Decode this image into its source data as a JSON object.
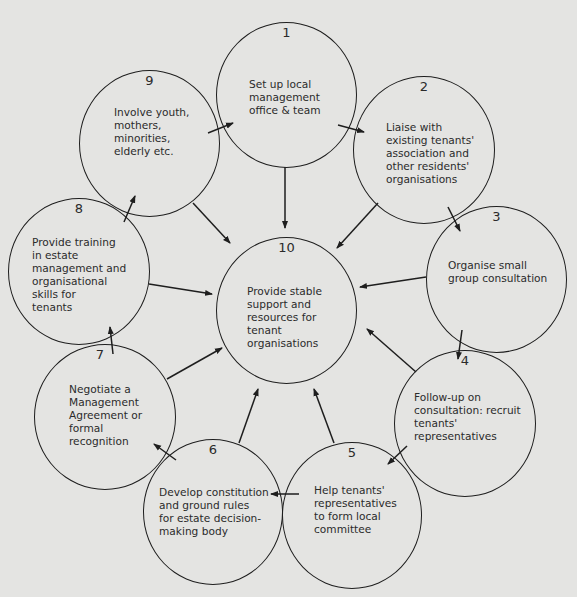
{
  "diagram": {
    "type": "cycle",
    "center": {
      "number": "10",
      "text": "Provide stable\nsupport and\nresources for\ntenant\norganisations"
    },
    "steps": [
      {
        "number": "1",
        "text": "Set up local\nmanagement\noffice & team"
      },
      {
        "number": "2",
        "text": "Liaise with\nexisting tenants'\nassociation and\nother residents'\norganisations"
      },
      {
        "number": "3",
        "text": "Organise small\ngroup consultation"
      },
      {
        "number": "4",
        "text": "Follow-up on\nconsultation: recruit\ntenants'\nrepresentatives"
      },
      {
        "number": "5",
        "text": "Help tenants'\nrepresentatives\nto form local\ncommittee"
      },
      {
        "number": "6",
        "text": "Develop constitution\nand ground rules\nfor estate decision-\nmaking body"
      },
      {
        "number": "7",
        "text": "Negotiate a\nManagement\nAgreement or\nformal\nrecognition"
      },
      {
        "number": "8",
        "text": "Provide training\nin estate\nmanagement and\norganisational\nskills for\ntenants"
      },
      {
        "number": "9",
        "text": "Involve youth,\nmothers,\nminorities,\nelderly etc."
      }
    ],
    "edges": [
      [
        "1",
        "2"
      ],
      [
        "2",
        "3"
      ],
      [
        "3",
        "4"
      ],
      [
        "4",
        "5"
      ],
      [
        "5",
        "6"
      ],
      [
        "6",
        "7"
      ],
      [
        "7",
        "8"
      ],
      [
        "8",
        "9"
      ],
      [
        "9",
        "1"
      ],
      [
        "1",
        "10"
      ],
      [
        "2",
        "10"
      ],
      [
        "3",
        "10"
      ],
      [
        "4",
        "10"
      ],
      [
        "5",
        "10"
      ],
      [
        "6",
        "10"
      ],
      [
        "7",
        "10"
      ],
      [
        "8",
        "10"
      ],
      [
        "9",
        "10"
      ]
    ],
    "colors": {
      "background": "#e4e4e2",
      "stroke": "#1e1e1e",
      "text": "#2b2b2b"
    }
  }
}
